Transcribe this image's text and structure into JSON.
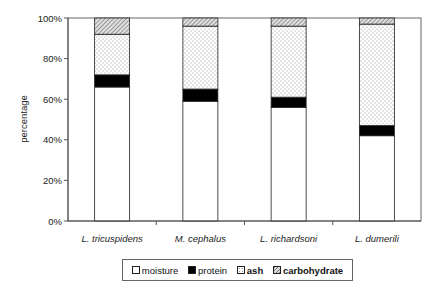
{
  "chart_data": {
    "type": "bar",
    "stacked": true,
    "percent_stacked": true,
    "title": "",
    "xlabel": "",
    "ylabel": "percentage",
    "ylim": [
      0,
      100
    ],
    "y_ticks": [
      "0%",
      "20%",
      "40%",
      "60%",
      "80%",
      "100%"
    ],
    "grid": false,
    "legend_position": "bottom",
    "categories": [
      "L. tricuspidens",
      "M. cephalus",
      "L. richardsoni",
      "L. dumerili"
    ],
    "series": [
      {
        "name": "moisture",
        "values": [
          66,
          59,
          56,
          42
        ],
        "fill": "white"
      },
      {
        "name": "protein",
        "values": [
          6,
          6,
          5,
          5
        ],
        "fill": "black"
      },
      {
        "name": "ash",
        "values": [
          20,
          31,
          35,
          50
        ],
        "fill": "dotted"
      },
      {
        "name": "carbohydrate",
        "values": [
          8,
          4,
          4,
          3
        ],
        "fill": "hatched"
      }
    ]
  },
  "legend": {
    "items": [
      {
        "label": "moisture",
        "bold": false
      },
      {
        "label": "protein",
        "bold": false
      },
      {
        "label": "ash",
        "bold": true
      },
      {
        "label": "carbohydrate",
        "bold": true
      }
    ]
  },
  "colors": {
    "axis": "#555555",
    "bar_outline": "#222222",
    "protein": "#000000",
    "ash_dots": "#999999",
    "carb_hatch": "#777777"
  }
}
